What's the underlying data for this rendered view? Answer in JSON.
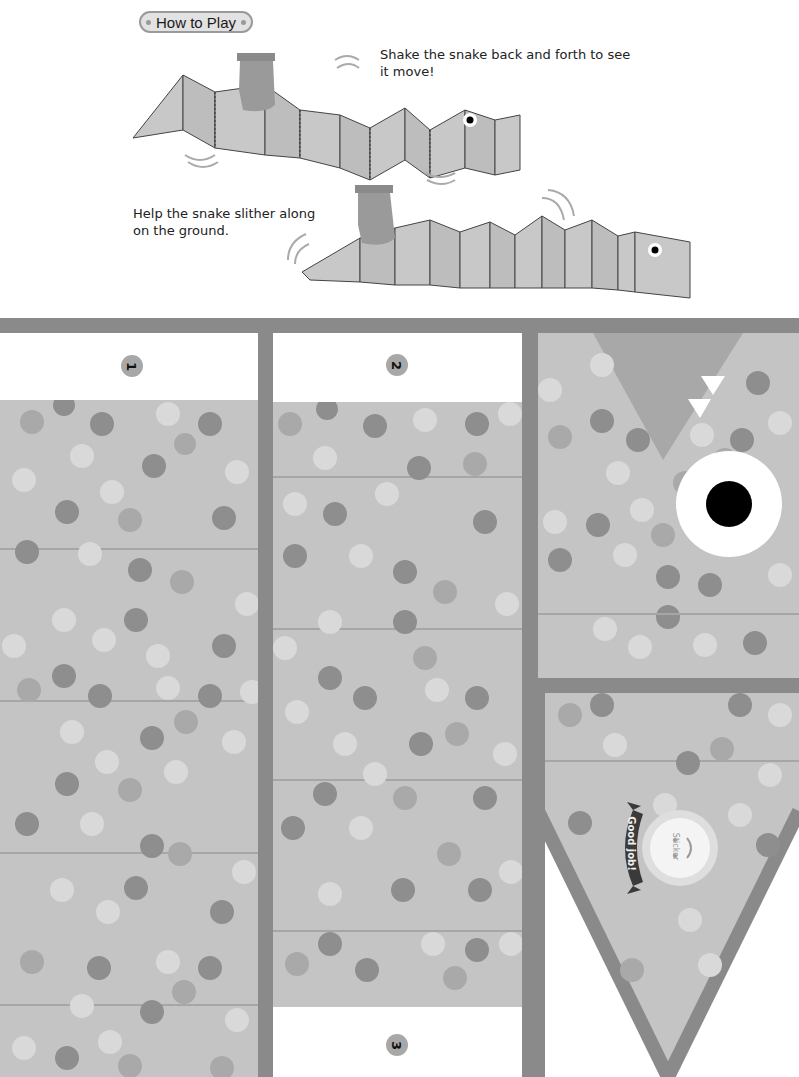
{
  "header": {
    "how_to_play_label": "How to Play"
  },
  "instructions": [
    {
      "line1": "Shake the snake back and forth to see",
      "line2": "it move!"
    },
    {
      "line1": "Help the snake slither along",
      "line2": "on the ground."
    }
  ],
  "panels": {
    "panel_1_number": "1",
    "panel_2_number": "2",
    "panel_3_number": "3"
  },
  "sticker": {
    "ribbon_text": "Good job!",
    "label": "Sticker"
  },
  "colors": {
    "frame": "#8a8a8a",
    "panel": "#c4c4c4",
    "dot_dark": "#8e8e8e",
    "dot_mid": "#a9a9a9",
    "dot_light": "#d9d9d9",
    "eye_white": "#ffffff",
    "pupil": "#000000"
  }
}
